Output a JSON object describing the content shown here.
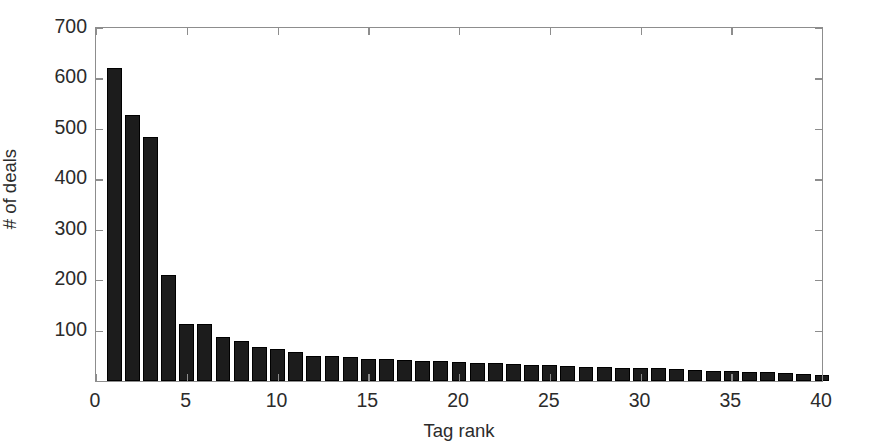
{
  "chart_data": {
    "type": "bar",
    "title": "",
    "subtitle": "",
    "xlabel": "Tag rank",
    "ylabel": "# of deals",
    "xlim": [
      0,
      40
    ],
    "ylim": [
      0,
      700
    ],
    "xticks": [
      0,
      5,
      10,
      15,
      20,
      25,
      30,
      35,
      40
    ],
    "yticks": [
      100,
      200,
      300,
      400,
      500,
      600,
      700
    ],
    "grid": false,
    "legend": null,
    "bar_color": "#1c1c1c",
    "axis_color": "#8d8d8d",
    "background_color": "#ffffff",
    "bar_width_fraction": 0.82,
    "categories": [
      1,
      2,
      3,
      4,
      5,
      6,
      7,
      8,
      9,
      10,
      11,
      12,
      13,
      14,
      15,
      16,
      17,
      18,
      19,
      20,
      21,
      22,
      23,
      24,
      25,
      26,
      27,
      28,
      29,
      30,
      31,
      32,
      33,
      34,
      35,
      36,
      37,
      38,
      39,
      40
    ],
    "values": [
      620,
      527,
      483,
      210,
      113,
      113,
      88,
      80,
      68,
      64,
      57,
      50,
      49,
      48,
      44,
      43,
      42,
      40,
      39,
      38,
      36,
      35,
      34,
      32,
      31,
      29,
      28,
      27,
      26,
      26,
      25,
      24,
      21,
      20,
      19,
      18,
      17,
      16,
      14,
      12
    ]
  },
  "axes": {
    "ytick_labels": [
      "100",
      "200",
      "300",
      "400",
      "500",
      "600",
      "700"
    ],
    "xtick_labels": [
      "0",
      "5",
      "10",
      "15",
      "20",
      "25",
      "30",
      "35",
      "40"
    ],
    "x_title": "Tag rank",
    "y_title": "# of deals"
  }
}
